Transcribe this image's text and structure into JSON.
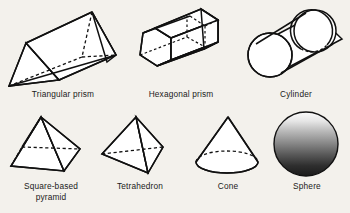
{
  "figure": {
    "background_color": "#f3f1ec",
    "stroke_color": "#111111",
    "rows": 2,
    "columns": 4
  },
  "shapes": [
    {
      "id": "triangular-prism",
      "label": "Triangular prism",
      "row": 1,
      "column": 1,
      "icon": "triangular-prism-icon",
      "faces": 5,
      "edges": 9,
      "vertices": 6
    },
    {
      "id": "hexagonal-prism",
      "label": "Hexagonal prism",
      "row": 1,
      "column": 2,
      "icon": "hexagonal-prism-icon",
      "faces": 8,
      "edges": 18,
      "vertices": 12
    },
    {
      "id": "cylinder",
      "label": "Cylinder",
      "row": 1,
      "column": 3,
      "icon": "cylinder-icon",
      "faces": 3,
      "edges": 2,
      "vertices": 0
    },
    {
      "id": "square-based-pyramid",
      "label": "Square-based\npyramid",
      "row": 2,
      "column": 1,
      "icon": "square-based-pyramid-icon",
      "faces": 5,
      "edges": 8,
      "vertices": 5
    },
    {
      "id": "tetrahedron",
      "label": "Tetrahedron",
      "row": 2,
      "column": 2,
      "icon": "tetrahedron-icon",
      "faces": 4,
      "edges": 6,
      "vertices": 4
    },
    {
      "id": "cone",
      "label": "Cone",
      "row": 2,
      "column": 3,
      "icon": "cone-icon",
      "faces": 2,
      "edges": 1,
      "vertices": 1
    },
    {
      "id": "sphere",
      "label": "Sphere",
      "row": 2,
      "column": 4,
      "icon": "sphere-icon",
      "faces": 1,
      "edges": 0,
      "vertices": 0,
      "shading": {
        "type": "vertical-gradient",
        "top_color": "#fbfbfb",
        "bottom_color": "#1b1b1b"
      }
    }
  ]
}
